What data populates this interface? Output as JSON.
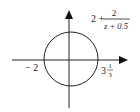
{
  "diagram": {
    "type": "contour-plot",
    "function_label": {
      "prefix": "2 +",
      "numerator": "2",
      "denominator": "z + 0.5"
    },
    "left_intercept_label": "− 2",
    "right_intercept_label": {
      "whole": "3",
      "numerator": "1",
      "denominator": "3"
    },
    "colors": {
      "stroke": "#222222",
      "background": "#ffffff"
    }
  }
}
